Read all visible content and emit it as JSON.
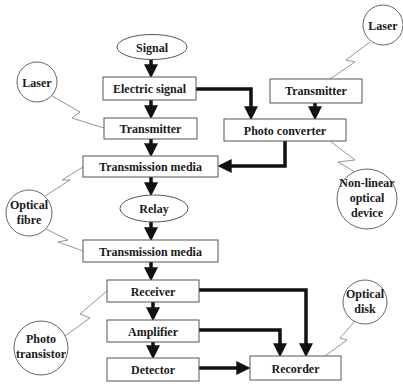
{
  "diagram": {
    "nodes": {
      "signal": "Signal",
      "electric_signal": "Electric signal",
      "transmitter": "Transmitter",
      "transmission_media_1": "Transmission media",
      "relay": "Relay",
      "transmission_media_2": "Transmission media",
      "receiver": "Receiver",
      "amplifier": "Amplifier",
      "detector": "Detector",
      "recorder": "Recorder",
      "transmitter_right": "Transmitter",
      "photo_converter": "Photo converter"
    },
    "callouts": {
      "laser_left": "Laser",
      "laser_right": "Laser",
      "optical_fibre_1": "Optical",
      "optical_fibre_2": "fibre",
      "nonlinear_1": "Non-linear",
      "nonlinear_2": "optical",
      "nonlinear_3": "device",
      "photo_transistor_1": "Photo",
      "photo_transistor_2": "transistor",
      "optical_disk_1": "Optical",
      "optical_disk_2": "disk"
    },
    "edges": [
      [
        "Signal",
        "Electric signal"
      ],
      [
        "Electric signal",
        "Transmitter"
      ],
      [
        "Electric signal",
        "Photo converter"
      ],
      [
        "Transmitter (right)",
        "Photo converter"
      ],
      [
        "Transmitter",
        "Transmission media"
      ],
      [
        "Photo converter",
        "Transmission media"
      ],
      [
        "Transmission media",
        "Relay"
      ],
      [
        "Relay",
        "Transmission media"
      ],
      [
        "Transmission media",
        "Receiver"
      ],
      [
        "Receiver",
        "Amplifier"
      ],
      [
        "Receiver",
        "Recorder"
      ],
      [
        "Amplifier",
        "Detector"
      ],
      [
        "Amplifier",
        "Recorder"
      ],
      [
        "Detector",
        "Recorder"
      ]
    ],
    "annotations": [
      [
        "Laser",
        "Transmitter"
      ],
      [
        "Laser",
        "Transmitter (right)"
      ],
      [
        "Non-linear optical device",
        "Photo converter"
      ],
      [
        "Optical fibre",
        "Transmission media"
      ],
      [
        "Optical fibre",
        "Transmission media (2)"
      ],
      [
        "Photo transistor",
        "Receiver"
      ],
      [
        "Optical disk",
        "Recorder"
      ]
    ]
  }
}
